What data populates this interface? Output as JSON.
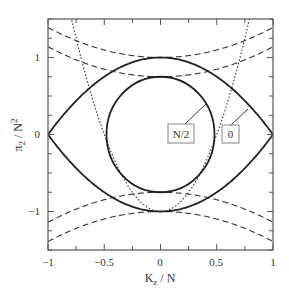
{
  "chart_data": {
    "type": "line",
    "title": "",
    "xlabel": "K_z / N",
    "ylabel": "π₂ / N²",
    "xlim": [
      -1,
      1
    ],
    "ylim": [
      -1.5,
      1.5
    ],
    "grid": false,
    "legend": "none",
    "x_ticks": [
      -1,
      -0.5,
      0,
      0.5,
      1
    ],
    "x_tick_labels": [
      "−1",
      "−0.5",
      "0",
      "0.5",
      "1"
    ],
    "y_ticks": [
      -1,
      0,
      1
    ],
    "y_tick_labels": [
      "−1",
      "0",
      "1"
    ],
    "series": [
      {
        "name": "outer boundary (solid)",
        "style": "solid",
        "formula": "y = ±(1 − x²)",
        "x": [
          -1,
          -0.75,
          -0.5,
          -0.25,
          0,
          0.25,
          0.5,
          0.75,
          1
        ],
        "values_upper": [
          0,
          0.44,
          0.75,
          0.94,
          1,
          0.94,
          0.75,
          0.44,
          0
        ],
        "values_lower": [
          0,
          -0.44,
          -0.75,
          -0.94,
          -1,
          -0.94,
          -0.75,
          -0.44,
          0
        ]
      },
      {
        "name": "inner ellipse (solid)",
        "style": "solid",
        "formula": "(x/0.48)² + (y/0.75)² = 1",
        "x_radius": 0.48,
        "y_radius": 0.75
      },
      {
        "name": "dotted parabola",
        "style": "dotted",
        "formula": "y = 4x² − 1",
        "x": [
          -0.79,
          -0.5,
          0,
          0.5,
          0.79
        ],
        "values": [
          1.5,
          0,
          -1,
          0,
          1.5
        ]
      },
      {
        "name": "dashed outer pair",
        "style": "dashed",
        "formula": "y = ±(1 + 0.39x²)",
        "x": [
          -1,
          -0.5,
          0,
          0.5,
          1
        ],
        "values_upper": [
          1.39,
          1.1,
          1.0,
          1.1,
          1.39
        ],
        "values_lower": [
          -1.39,
          -1.1,
          -1.0,
          -1.1,
          -1.39
        ]
      },
      {
        "name": "dashed inner pair",
        "style": "dashed",
        "formula": "y = ±(0.75 + 0.39x²)",
        "x": [
          -1,
          -0.5,
          0,
          0.5,
          1
        ],
        "values_upper": [
          1.14,
          0.85,
          0.75,
          0.85,
          1.14
        ],
        "values_lower": [
          -1.14,
          -0.85,
          -0.75,
          -0.85,
          -1.14
        ]
      }
    ],
    "annotations": [
      {
        "text": "N/2",
        "points_to": "inner ellipse",
        "box": true
      },
      {
        "text": "0",
        "points_to": "outer boundary",
        "box": true
      }
    ]
  },
  "labels": {
    "xlabel_main": "K",
    "xlabel_sub": "z",
    "xlabel_rest": " / N",
    "ylabel_main": "π",
    "ylabel_sub": "2",
    "ylabel_mid": " / N",
    "ylabel_sup": "2",
    "x_ticks": [
      "−1",
      "−0.5",
      "0",
      "0.5",
      "1"
    ],
    "y_ticks": [
      "1",
      "0",
      "−1"
    ],
    "annotation_inner": "N/2",
    "annotation_outer": "0"
  }
}
